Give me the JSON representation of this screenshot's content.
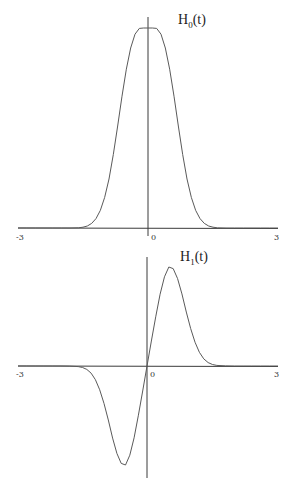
{
  "chart_data": [
    {
      "type": "line",
      "title": "H0(t)",
      "title_main": "H",
      "title_sub": "0",
      "title_tail": "(t)",
      "xlabel": "",
      "ylabel": "",
      "xlim": [
        -3,
        3
      ],
      "ylim": [
        0,
        1.05
      ],
      "grid": false,
      "legend": "none",
      "x_ticks": [
        {
          "value": -3,
          "label": "-3"
        },
        {
          "value": 0,
          "label": "0"
        },
        {
          "value": 3,
          "label": "3"
        }
      ],
      "series": [
        {
          "name": "H0",
          "x": [
            -3,
            -2.8,
            -2.6,
            -2.4,
            -2.2,
            -2,
            -1.8,
            -1.6,
            -1.5,
            -1.4,
            -1.3,
            -1.2,
            -1.1,
            -1,
            -0.9,
            -0.8,
            -0.7,
            -0.6,
            -0.5,
            -0.4,
            -0.3,
            -0.2,
            -0.1,
            0,
            0.1,
            0.2,
            0.3,
            0.4,
            0.5,
            0.6,
            0.7,
            0.8,
            0.9,
            1,
            1.1,
            1.2,
            1.3,
            1.4,
            1.5,
            1.6,
            1.8,
            2,
            2.2,
            2.4,
            2.6,
            2.8,
            3
          ],
          "y": [
            0,
            0,
            0,
            0,
            0,
            0,
            0,
            0.001,
            0.004,
            0.01,
            0.023,
            0.047,
            0.088,
            0.153,
            0.245,
            0.368,
            0.51,
            0.659,
            0.794,
            0.9,
            0.969,
            0.998,
            1.0,
            1.0,
            1.0,
            0.998,
            0.969,
            0.9,
            0.794,
            0.659,
            0.51,
            0.368,
            0.245,
            0.153,
            0.088,
            0.047,
            0.023,
            0.01,
            0.004,
            0.001,
            0,
            0,
            0,
            0,
            0,
            0,
            0
          ]
        }
      ]
    },
    {
      "type": "line",
      "title": "H1(t)",
      "title_main": "H",
      "title_sub": "1",
      "title_tail": "(t)",
      "xlabel": "",
      "ylabel": "",
      "xlim": [
        -3,
        3
      ],
      "ylim": [
        -1.05,
        1.05
      ],
      "grid": false,
      "legend": "none",
      "x_ticks": [
        {
          "value": -3,
          "label": "-3"
        },
        {
          "value": 0,
          "label": "0"
        },
        {
          "value": 3,
          "label": "3"
        }
      ],
      "series": [
        {
          "name": "H1",
          "x": [
            -3,
            -2.8,
            -2.6,
            -2.4,
            -2.2,
            -2,
            -1.8,
            -1.6,
            -1.5,
            -1.4,
            -1.3,
            -1.2,
            -1.1,
            -1,
            -0.9,
            -0.8,
            -0.7,
            -0.6,
            -0.5,
            -0.4,
            -0.3,
            -0.2,
            -0.1,
            0,
            0.1,
            0.2,
            0.3,
            0.4,
            0.5,
            0.6,
            0.7,
            0.8,
            0.9,
            1,
            1.1,
            1.2,
            1.3,
            1.4,
            1.5,
            1.6,
            1.8,
            2,
            2.2,
            2.4,
            2.6,
            2.8,
            3
          ],
          "y": [
            0,
            0,
            0,
            0,
            0,
            0,
            -0.001,
            -0.004,
            -0.01,
            -0.023,
            -0.048,
            -0.092,
            -0.16,
            -0.252,
            -0.363,
            -0.485,
            -0.588,
            -0.655,
            -0.666,
            -0.6,
            -0.483,
            -0.331,
            -0.168,
            0,
            0.168,
            0.331,
            0.483,
            0.6,
            0.666,
            0.655,
            0.588,
            0.485,
            0.363,
            0.252,
            0.16,
            0.092,
            0.048,
            0.023,
            0.01,
            0.004,
            0.001,
            0,
            0,
            0,
            0,
            0,
            0
          ]
        }
      ]
    }
  ]
}
